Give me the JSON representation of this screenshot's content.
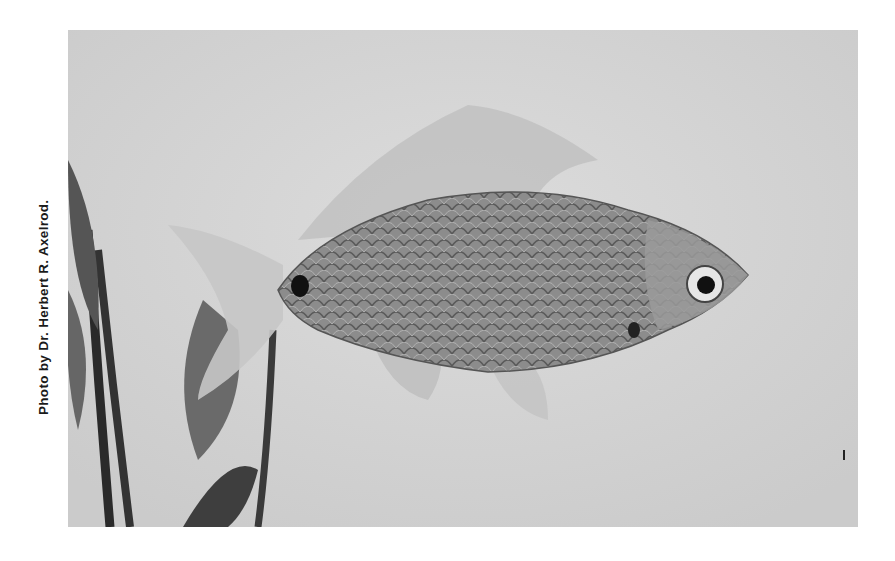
{
  "caption": "Photo by Dr. Herbert R. Axelrod.",
  "photo": {
    "subject": "fish-with-scales-and-aquatic-plant",
    "colors": {
      "background": "#d6d6d6",
      "body": "#8a8a8a",
      "fins": "#c4c4c4",
      "plant": "#4a4a4a"
    }
  }
}
